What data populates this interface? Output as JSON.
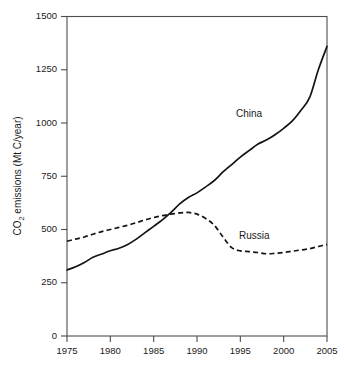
{
  "chart_data": {
    "type": "line",
    "title": "",
    "subtitle": "",
    "xlabel": "",
    "ylabel": "CO2 emissions (Mt C/year)",
    "ylabel_prefix": "CO",
    "ylabel_sub": "2",
    "ylabel_suffix": " emissions (Mt C/year)",
    "xlim": [
      1975,
      2005
    ],
    "ylim": [
      0,
      1500
    ],
    "yticks": [
      0,
      250,
      500,
      750,
      1000,
      1250,
      1500
    ],
    "ytick_labels": [
      "0",
      "250",
      "500",
      "750",
      "1000",
      "1250",
      "1500"
    ],
    "xticks": [
      1975,
      1980,
      1985,
      1990,
      1995,
      2000,
      2005
    ],
    "xtick_labels": [
      "1975",
      "1980",
      "1985",
      "1990",
      "1995",
      "2000",
      "2005"
    ],
    "grid": false,
    "legend_position": "inline-annotation",
    "x": [
      1975,
      1976,
      1977,
      1978,
      1979,
      1980,
      1981,
      1982,
      1983,
      1984,
      1985,
      1986,
      1987,
      1988,
      1989,
      1990,
      1991,
      1992,
      1993,
      1994,
      1995,
      1996,
      1997,
      1998,
      1999,
      2000,
      2001,
      2002,
      2003,
      2004,
      2005
    ],
    "series": [
      {
        "name": "China",
        "style": "solid",
        "color": "#141414",
        "label": "China",
        "values": [
          310,
          325,
          345,
          370,
          385,
          400,
          412,
          430,
          455,
          485,
          515,
          545,
          580,
          620,
          650,
          672,
          700,
          730,
          770,
          805,
          840,
          870,
          900,
          920,
          945,
          975,
          1010,
          1060,
          1120,
          1250,
          1360
        ]
      },
      {
        "name": "Russia",
        "style": "dashed",
        "color": "#141414",
        "label": "Russia",
        "values": [
          445,
          455,
          465,
          478,
          490,
          500,
          510,
          520,
          532,
          545,
          556,
          565,
          572,
          578,
          580,
          572,
          552,
          520,
          465,
          415,
          400,
          396,
          392,
          386,
          388,
          392,
          398,
          404,
          410,
          420,
          430
        ]
      }
    ],
    "annotations": [
      {
        "text": "China",
        "x": 1996.0,
        "y": 1040,
        "name": "china-series-label"
      },
      {
        "text": "Russia",
        "x": 1996.6,
        "y": 470,
        "name": "russia-series-label"
      }
    ]
  }
}
